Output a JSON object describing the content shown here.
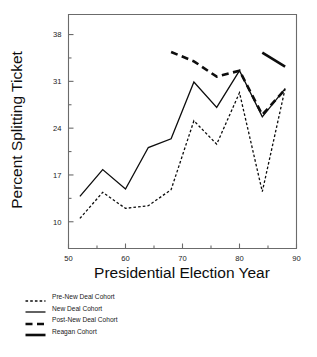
{
  "chart_data": {
    "type": "line",
    "title": "",
    "xlabel": "Presidential Election Year",
    "ylabel": "Percent Splitting Ticket",
    "xlim": [
      50,
      90
    ],
    "ylim": [
      6,
      41
    ],
    "grid": false,
    "legend_position": "below-left",
    "xticks": [
      50,
      60,
      70,
      80,
      90
    ],
    "xticklabels": [
      "50",
      "60",
      "70",
      "80",
      "90"
    ],
    "xminorticks": [
      55,
      65,
      75,
      85
    ],
    "yticks": [
      10,
      17,
      24,
      31,
      38
    ],
    "yticklabels": [
      "10",
      "17",
      "24",
      "31",
      "38"
    ],
    "yminorticks": [
      13.5,
      20.5,
      27.5,
      34.5
    ],
    "series": [
      {
        "name": "Pre-New Deal Cohort",
        "style": "fine-dashed",
        "x": [
          52,
          56,
          60,
          64,
          68,
          72,
          76,
          80,
          84,
          88
        ],
        "values": [
          10.5,
          14.4,
          12.0,
          12.4,
          14.8,
          25.1,
          21.6,
          29.3,
          14.5,
          29.9
        ]
      },
      {
        "name": "New Deal Cohort",
        "style": "thin-solid",
        "x": [
          52,
          56,
          60,
          64,
          68,
          72,
          76,
          80,
          84,
          88
        ],
        "values": [
          13.8,
          17.8,
          14.9,
          21.1,
          22.4,
          30.9,
          27.1,
          32.6,
          25.7,
          29.9
        ]
      },
      {
        "name": "Post-New Deal Cohort",
        "style": "thick-dashed",
        "x": [
          68,
          72,
          76,
          80,
          84,
          88
        ],
        "values": [
          35.4,
          34.0,
          31.7,
          32.6,
          26.0,
          29.8
        ]
      },
      {
        "name": "Reagan Cohort",
        "style": "thick-solid",
        "x": [
          84,
          88
        ],
        "values": [
          35.3,
          33.2
        ]
      }
    ]
  },
  "legend": {
    "items": [
      {
        "label": "Pre-New Deal Cohort"
      },
      {
        "label": "New Deal Cohort"
      },
      {
        "label": "Post-New Deal Cohort"
      },
      {
        "label": "Reagan Cohort"
      }
    ]
  },
  "colors": {
    "ink": "#0d0d0d",
    "axis": "#6b6b6b",
    "background": "#ffffff"
  }
}
